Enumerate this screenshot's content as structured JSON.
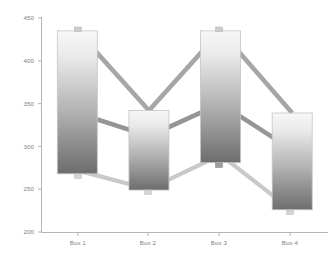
{
  "chart_data": {
    "type": "bar",
    "chart_subtype": "floating-range-bar-with-connector-lines",
    "title": "",
    "subtitle": "",
    "xlabel": "",
    "ylabel": "",
    "categories": [
      "Box 1",
      "Box 2",
      "Box 3",
      "Box 4"
    ],
    "ylim": [
      200,
      450
    ],
    "yticks": [
      200,
      250,
      300,
      350,
      400,
      450
    ],
    "ytick_labels": [
      "200",
      "250",
      "300",
      "350",
      "400",
      "450"
    ],
    "xtick_labels": [
      "Box 1",
      "Box 2",
      "Box 3",
      "Box 4"
    ],
    "grid": false,
    "legend": null,
    "legend_position": "none",
    "axis_color": "#b0b0b0",
    "tick_label_color": "#808080",
    "bar_top_color": "#f2f2f2",
    "bar_bottom_color": "#6e6e6e",
    "bar_border_color": "#bfbfbf",
    "series": [
      {
        "name": "Max",
        "values": [
          435,
          342,
          435,
          339
        ],
        "line_color": "#a6a6a6",
        "marker": "square"
      },
      {
        "name": "Median",
        "values": [
          339,
          312,
          350,
          296
        ],
        "line_color": "#959595",
        "marker": "none"
      },
      {
        "name": "Min",
        "values": [
          272,
          250,
          290,
          225
        ],
        "line_color": "#c9c9c9",
        "marker": "square"
      }
    ],
    "bars": [
      {
        "category": "Box 1",
        "top": 435,
        "bottom": 268
      },
      {
        "category": "Box 2",
        "top": 342,
        "bottom": 249
      },
      {
        "category": "Box 3",
        "top": 435,
        "bottom": 281
      },
      {
        "category": "Box 4",
        "top": 339,
        "bottom": 226
      }
    ]
  },
  "axis": {
    "y_labels": [
      "450",
      "400",
      "350",
      "300",
      "250",
      "200"
    ],
    "x_labels": [
      "Box 1",
      "Box 2",
      "Box 3",
      "Box 4"
    ]
  }
}
